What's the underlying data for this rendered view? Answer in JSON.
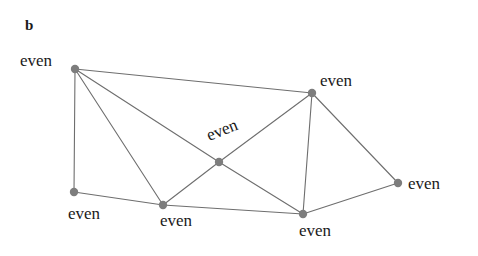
{
  "figure": {
    "panel_label": "b",
    "background_color": "#ffffff",
    "edge_color": "#6e6e6e",
    "node_color": "#7d7d7d",
    "label_color": "#1a1a1a",
    "width": 478,
    "height": 256
  },
  "graph": {
    "description": "Planar graph with seven vertices, each labelled even",
    "nodes": [
      {
        "id": "n1",
        "label": "even",
        "x": 75,
        "y": 69,
        "label_x": 20,
        "label_y": 52,
        "rotation": 0
      },
      {
        "id": "n2",
        "label": "even",
        "x": 312,
        "y": 93,
        "label_x": 320,
        "label_y": 72,
        "rotation": 0
      },
      {
        "id": "n3",
        "label": "even",
        "x": 219,
        "y": 162,
        "label_x": 204,
        "label_y": 128,
        "rotation": -22
      },
      {
        "id": "n4",
        "label": "even",
        "x": 74,
        "y": 192,
        "label_x": 68,
        "label_y": 205,
        "rotation": 0
      },
      {
        "id": "n5",
        "label": "even",
        "x": 163,
        "y": 205,
        "label_x": 160,
        "label_y": 212,
        "rotation": 0
      },
      {
        "id": "n6",
        "label": "even",
        "x": 303,
        "y": 214,
        "label_x": 299,
        "label_y": 222,
        "rotation": 0
      },
      {
        "id": "n7",
        "label": "even",
        "x": 398,
        "y": 183,
        "label_x": 408,
        "label_y": 175,
        "rotation": 0
      }
    ],
    "edges": [
      {
        "from": "n1",
        "to": "n2"
      },
      {
        "from": "n1",
        "to": "n3"
      },
      {
        "from": "n1",
        "to": "n5"
      },
      {
        "from": "n1",
        "to": "n4"
      },
      {
        "from": "n2",
        "to": "n3"
      },
      {
        "from": "n2",
        "to": "n6"
      },
      {
        "from": "n2",
        "to": "n7"
      },
      {
        "from": "n3",
        "to": "n5"
      },
      {
        "from": "n3",
        "to": "n6"
      },
      {
        "from": "n4",
        "to": "n5"
      },
      {
        "from": "n5",
        "to": "n6"
      },
      {
        "from": "n6",
        "to": "n7"
      }
    ],
    "node_radius": 4.2,
    "edge_width": 1.1
  }
}
